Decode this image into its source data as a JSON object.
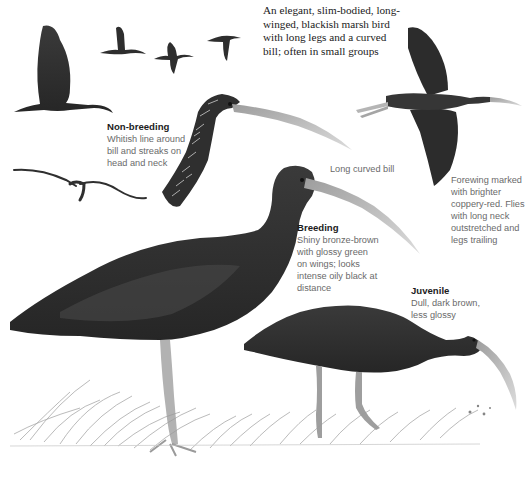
{
  "plate": {
    "intro": "An elegant, slim-bodied, long-\nwinged, blackish marsh bird\nwith long legs and a curved\nbill; often in small groups",
    "labels": {
      "non_breeding": {
        "title": "Non-breeding",
        "text": "Whitish line around\nbill and streaks on\nhead and neck"
      },
      "bill": {
        "text": "Long curved bill"
      },
      "flight": {
        "text": "Forewing marked\nwith brighter\ncoppery-red. Flies\nwith long neck\noutstretched and\nlegs trailing"
      },
      "breeding": {
        "title": "Breeding",
        "text": "Shiny bronze-brown\nwith glossy green\non wings; looks\nintense oily black at\ndistance"
      },
      "juvenile": {
        "title": "Juvenile",
        "text": "Dull, dark brown,\nless glossy"
      }
    },
    "illustrations": [
      "flock-in-flight-icon",
      "large-flying-bird-left-icon",
      "gliding-bird-icon",
      "non-breeding-head-icon",
      "flying-bird-right-icon",
      "breeding-adult-standing-icon",
      "juvenile-feeding-icon",
      "marsh-grass-icon"
    ],
    "colors": {
      "ink_dark": "#2b2b2b",
      "ink_mid": "#4a4a4a",
      "bill": "#bdbdbd",
      "legs": "#a9a9a9",
      "grass": "#9a9a9a",
      "label_title": "#1c1c1c",
      "label_text": "#6a6a6a"
    }
  }
}
